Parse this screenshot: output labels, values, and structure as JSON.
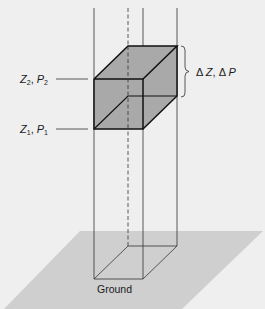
{
  "diagram": {
    "type": "atmospheric air column with volume element",
    "labels": {
      "upper": {
        "var1": "Z",
        "sub1": "2",
        "sep": ", ",
        "var2": "P",
        "sub2": "2"
      },
      "lower": {
        "var1": "Z",
        "sub1": "1",
        "sep": ", ",
        "var2": "P",
        "sub2": "1"
      },
      "delta": {
        "d1": "Δ",
        "var1": "Z",
        "sep": ", ",
        "d2": "Δ",
        "var2": "P"
      },
      "ground": "Ground"
    },
    "colors": {
      "background": "#efefef",
      "ground_plane": "#cfcfcf",
      "cube_fill": "#a9a9a9",
      "line": "#1a1a1a"
    }
  }
}
